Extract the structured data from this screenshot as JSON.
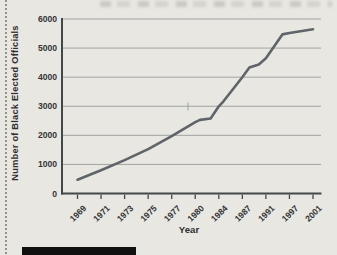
{
  "page": {
    "colors": {
      "background": "#e8e7e2",
      "grid": "#a0a4a0",
      "axis": "#42474a",
      "line": "#5f6468",
      "label_text": "#333537",
      "caption_bar": "#101010"
    }
  },
  "chart_data": {
    "type": "line",
    "title": "",
    "xlabel": "Year",
    "ylabel": "Number of Black Elected Officials",
    "x_tick_labels": [
      "1969",
      "1971",
      "1973",
      "1975",
      "1977",
      "1980",
      "1984",
      "1987",
      "1991",
      "1997",
      "2001"
    ],
    "y_ticks": [
      0,
      1000,
      2000,
      3000,
      4000,
      5000,
      6000
    ],
    "ylim": [
      0,
      6000
    ],
    "grid": "horizontal",
    "legend": "none",
    "x_axis_note": "categorical ticks equally spaced despite unequal year gaps; labels rotated 45 degrees",
    "series": [
      {
        "name": "black-elected-officials",
        "color": "#5f6468",
        "values_at_ticks": [
          475,
          800,
          1150,
          1525,
          1975,
          2450,
          3000,
          4000,
          4650,
          5500,
          5650
        ],
        "shape_points": [
          [
            0,
            475
          ],
          [
            1,
            800
          ],
          [
            2,
            1150
          ],
          [
            3,
            1525
          ],
          [
            4,
            1975
          ],
          [
            5,
            2450
          ],
          [
            5.2,
            2530
          ],
          [
            5.65,
            2580
          ],
          [
            6,
            3000
          ],
          [
            6.2,
            3170
          ],
          [
            7,
            4000
          ],
          [
            7.3,
            4330
          ],
          [
            7.7,
            4440
          ],
          [
            8,
            4650
          ],
          [
            8.7,
            5470
          ],
          [
            9,
            5520
          ],
          [
            10,
            5650
          ]
        ]
      }
    ]
  }
}
